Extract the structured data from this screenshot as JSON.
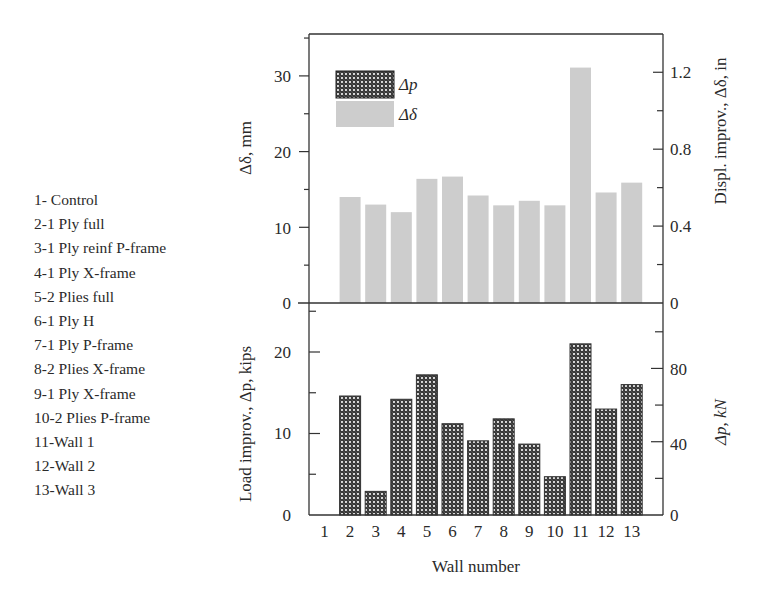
{
  "chart_data": [
    {
      "type": "bar",
      "panel": "top",
      "title": "",
      "series": [
        {
          "name": "Δδ",
          "values": [
            0,
            14.0,
            13.0,
            12.0,
            16.4,
            16.7,
            14.2,
            12.9,
            13.5,
            12.9,
            31.1,
            14.6,
            15.9
          ]
        }
      ],
      "categories": [
        "1",
        "2",
        "3",
        "4",
        "5",
        "6",
        "7",
        "8",
        "9",
        "10",
        "11",
        "12",
        "13"
      ],
      "xlabel": "Wall number",
      "ylabel": "Δδ, mm",
      "ylabel_right": "Displ. improv., Δδ, in",
      "ylim": [
        0,
        35.5
      ],
      "yticks": [
        0,
        10,
        20,
        30
      ],
      "yticks_right": [
        "0",
        "0.4",
        "0.8",
        "1.2"
      ],
      "color": "#cdcdcd",
      "grid": false
    },
    {
      "type": "bar",
      "panel": "bottom",
      "title": "",
      "series": [
        {
          "name": "Δp",
          "values": [
            0,
            14.6,
            2.9,
            14.2,
            17.2,
            11.2,
            9.1,
            11.8,
            8.7,
            4.7,
            21.0,
            13.0,
            16.0
          ]
        }
      ],
      "categories": [
        "1",
        "2",
        "3",
        "4",
        "5",
        "6",
        "7",
        "8",
        "9",
        "10",
        "11",
        "12",
        "13"
      ],
      "xlabel": "Wall number",
      "ylabel": "Load improv., Δp, kips",
      "ylabel_right": "Δp, kN",
      "ylim": [
        0,
        26
      ],
      "yticks": [
        0,
        10,
        20
      ],
      "yticks_right": [
        "0",
        "40",
        "80"
      ],
      "pattern": "crosshatch",
      "grid": false
    }
  ],
  "legend": {
    "items": [
      {
        "label": "Δp",
        "style": "crosshatch"
      },
      {
        "label": "Δδ",
        "style": "gray"
      }
    ]
  },
  "top_axis": {
    "left_ticks": [
      "0",
      "10",
      "20",
      "30"
    ],
    "right_ticks": [
      "0",
      "0.4",
      "0.8",
      "1.2"
    ],
    "left_label": "Δδ, mm",
    "right_label": "Displ. improv., Δδ, in"
  },
  "bottom_axis": {
    "left_ticks": [
      "0",
      "10",
      "20"
    ],
    "right_ticks": [
      "0",
      "40",
      "80"
    ],
    "left_label": "Load improv., Δp, kips",
    "right_label": "Δp, kN",
    "x_ticks": [
      "1",
      "2",
      "3",
      "4",
      "5",
      "6",
      "7",
      "8",
      "9",
      "10",
      "11",
      "12",
      "13"
    ],
    "x_label": "Wall number"
  },
  "wall_list": [
    "1- Control",
    "2-1 Ply full",
    "3-1 Ply reinf P-frame",
    "4-1 Ply X-frame",
    "5-2 Plies full",
    "6-1 Ply H",
    "7-1 Ply P-frame",
    "8-2 Plies X-frame",
    "9-1 Ply X-frame",
    "10-2 Plies P-frame",
    "11-Wall 1",
    "12-Wall 2",
    "13-Wall 3"
  ]
}
